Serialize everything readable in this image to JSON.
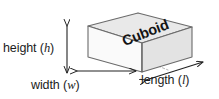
{
  "figure": {
    "kind": "geometry-diagram",
    "subject": "cuboid",
    "background_color": "#ffffff",
    "line_color": "#555555",
    "text_color": "#1c1c1c"
  },
  "shape": {
    "name_label": "Cuboid",
    "faces": {
      "top_fill": "#e9e9e9",
      "front_left_fill": "#fafafa",
      "front_right_fill": "#e3e3e3",
      "edge_stroke": "#6b6b6b",
      "hidden_edge_stroke": "#b0b0b0"
    }
  },
  "dimensions": [
    {
      "id": "height",
      "word": "height",
      "variable": "h",
      "label": "height (h)",
      "arrow": "vertical-double",
      "position": "left"
    },
    {
      "id": "width",
      "word": "width",
      "variable": "w",
      "label": "width (w)",
      "arrow": "horizontal-double",
      "position": "bottom-left"
    },
    {
      "id": "length",
      "word": "length",
      "variable": "l",
      "label": "length (l)",
      "arrow": "diagonal-double",
      "position": "bottom-right"
    }
  ],
  "paren": {
    "open": "(",
    "close": ")"
  }
}
